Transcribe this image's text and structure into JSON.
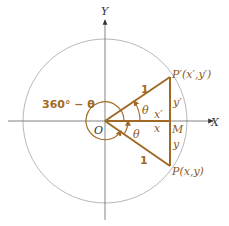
{
  "diagram": {
    "axes": {
      "x_label": "X",
      "y_label": "Y",
      "origin_label": "O"
    },
    "points": {
      "p_prime": "P′(x′,y′)",
      "p": "P(x,y)",
      "m": "M"
    },
    "segment_labels": {
      "radius_upper": "1",
      "radius_lower": "1",
      "x_prime": "x′",
      "x": "x",
      "y_prime": "y′",
      "y": "y"
    },
    "angle_labels": {
      "theta_upper": "θ",
      "theta_lower": "θ",
      "reflex": "360° − θ"
    },
    "colors": {
      "triangle": "#a06a26",
      "circle": "#b8b8b8",
      "axis": "#555555",
      "label": "#8a5a1e"
    }
  }
}
